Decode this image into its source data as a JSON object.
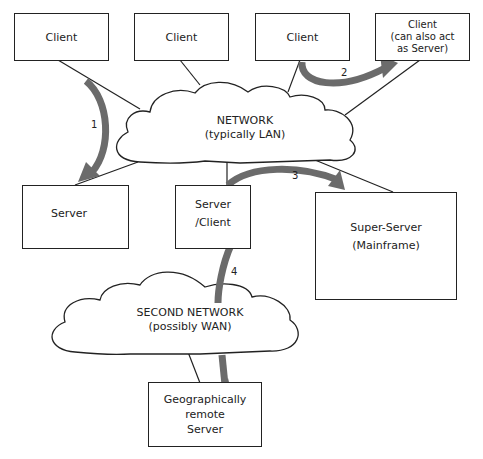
{
  "diagram": {
    "type": "network-architecture",
    "nodes": [
      {
        "id": "client1",
        "lines": [
          "Client"
        ]
      },
      {
        "id": "client2",
        "lines": [
          "Client"
        ]
      },
      {
        "id": "client3",
        "lines": [
          "Client"
        ]
      },
      {
        "id": "client4",
        "lines": [
          "Client",
          "(can also act",
          "as Server)"
        ]
      },
      {
        "id": "server",
        "lines": [
          "Server"
        ]
      },
      {
        "id": "server_client",
        "lines": [
          "Server",
          "/Client"
        ]
      },
      {
        "id": "super_server",
        "lines": [
          "Super-Server",
          "(Mainframe)"
        ]
      },
      {
        "id": "remote_server",
        "lines": [
          "Geographically",
          "remote",
          "Server"
        ]
      }
    ],
    "networks": [
      {
        "id": "network",
        "lines": [
          "NETWORK",
          "(typically LAN)"
        ]
      },
      {
        "id": "second_network",
        "lines": [
          "SECOND NETWORK",
          "(possibly  WAN)"
        ]
      }
    ],
    "flows": [
      {
        "label": "1",
        "from": "client1",
        "to": "server"
      },
      {
        "label": "2",
        "from": "client3",
        "to": "client4"
      },
      {
        "label": "3",
        "from": "server_client",
        "to": "super_server"
      },
      {
        "label": "4",
        "from": "server_client",
        "to": "remote_server"
      }
    ],
    "colors": {
      "arrow": "#6b6b6b",
      "line": "#222222",
      "box_fill": "#ffffff"
    }
  }
}
